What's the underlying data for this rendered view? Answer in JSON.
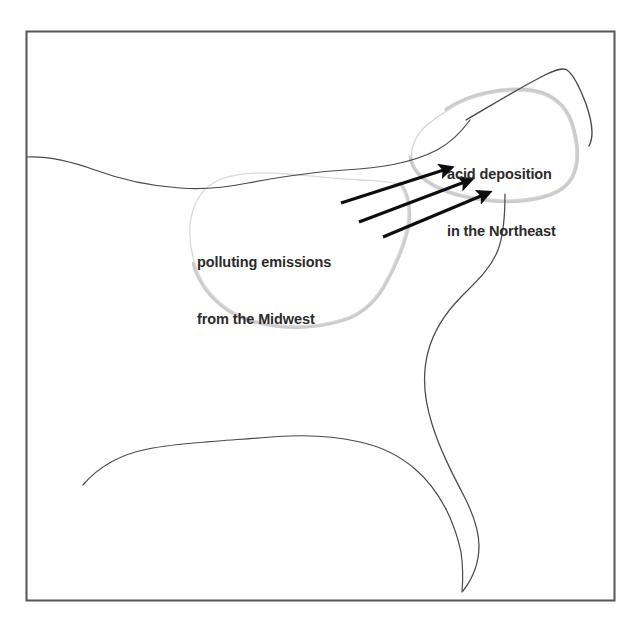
{
  "figure": {
    "background_color": "#ffffff",
    "frame": {
      "name": "map-border",
      "color": "#55555a",
      "x": 26,
      "y": 31,
      "width": 588,
      "height": 569,
      "stroke_width": 2
    }
  },
  "labels": {
    "northeast": {
      "line1": "acid deposition",
      "line2": "in the Northeast",
      "color": "#2b2b2b",
      "x": 447,
      "y": 127
    },
    "midwest": {
      "line1": "polluting emissions",
      "line2": "from the Midwest",
      "color": "#2b2b2b",
      "x": 197,
      "y": 215
    }
  },
  "regions": [
    {
      "name": "midwest-region",
      "label": "Midwest source region",
      "fill": "#ffffff",
      "outline_light": "#d9d9d9",
      "outline_shadow": "#c0c0c0",
      "shadow_width": 6
    },
    {
      "name": "northeast-region",
      "label": "Northeast receptor region",
      "fill": "#ffffff",
      "outline_light": "#d0d0d0",
      "outline_shadow": "#bdbdbd",
      "shadow_width": 6
    }
  ],
  "coastlines": [
    {
      "name": "northern-border-line",
      "color": "#4a4a4a",
      "stroke_width": 1.2
    },
    {
      "name": "new-england-north-line",
      "color": "#4a4a4a",
      "stroke_width": 1.4
    },
    {
      "name": "east-coast-line",
      "color": "#4a4a4a",
      "stroke_width": 1.2
    },
    {
      "name": "gulf-coast-line",
      "color": "#4a4a4a",
      "stroke_width": 1.2
    },
    {
      "name": "florida-line",
      "color": "#4a4a4a",
      "stroke_width": 1.2
    }
  ],
  "arrows": {
    "color": "#0d0d0d",
    "count": 3,
    "description": "transport of polluting emissions from the Midwest to the Northeast",
    "items": [
      {
        "name": "transport-arrow-1",
        "x1": 341,
        "y1": 203,
        "x2": 455,
        "y2": 167
      },
      {
        "name": "transport-arrow-2",
        "x1": 359,
        "y1": 222,
        "x2": 475,
        "y2": 179
      },
      {
        "name": "transport-arrow-3",
        "x1": 383,
        "y1": 237,
        "x2": 492,
        "y2": 192
      }
    ]
  }
}
